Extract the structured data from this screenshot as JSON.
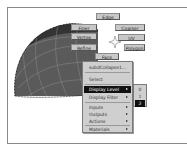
{
  "viewport": {
    "object_name": "subdivision-sphere",
    "colors": {
      "surface": "#5a5a5a",
      "surface_dark": "#333333",
      "wire": "#8e8e8e",
      "background": "#ffffff"
    }
  },
  "marking_menu": {
    "items": [
      {
        "label": "Edge",
        "position": "north"
      },
      {
        "label": "Finer",
        "position": "north-west"
      },
      {
        "label": "Coarser",
        "position": "north-east"
      },
      {
        "label": "Vertex",
        "position": "west"
      },
      {
        "label": "UV",
        "position": "east"
      },
      {
        "label": "Refine",
        "position": "south-west"
      },
      {
        "label": "Polygon",
        "position": "south-east"
      },
      {
        "label": "Face",
        "position": "south"
      }
    ]
  },
  "context_menu": {
    "header": "subdCollapse1...",
    "items": [
      {
        "label": "Select",
        "submenu": false
      },
      {
        "label": "Display Level",
        "submenu": true,
        "highlighted": true
      },
      {
        "label": "Display Filter",
        "submenu": true
      },
      {
        "label": "Inputs",
        "submenu": true
      },
      {
        "label": "Outputs",
        "submenu": true
      },
      {
        "label": "Actions",
        "submenu": true
      },
      {
        "label": "Materials",
        "submenu": true
      }
    ]
  },
  "display_level_submenu": {
    "items": [
      {
        "label": "0"
      },
      {
        "label": "1"
      },
      {
        "label": "2",
        "highlighted": true
      }
    ]
  }
}
